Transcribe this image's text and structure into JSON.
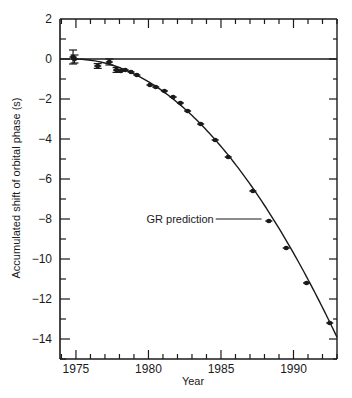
{
  "chart_data": {
    "type": "scatter",
    "title": "",
    "xlabel": "Year",
    "ylabel": "Accumulated shift of orbital phase (s)",
    "xlim": [
      1973.9,
      1993.0
    ],
    "ylim": [
      -15,
      2
    ],
    "xticks": [
      1975,
      1980,
      1985,
      1990
    ],
    "xtick_labels": [
      "1975",
      "1980",
      "1985",
      "1990"
    ],
    "x_minor_step": 1,
    "yticks": [
      2,
      0,
      -2,
      -4,
      -6,
      -8,
      -10,
      -12,
      -14
    ],
    "ytick_labels": [
      "2",
      "0",
      "−2",
      "−4",
      "−6",
      "−8",
      "−10",
      "−12",
      "−14"
    ],
    "y_minor_step": 1,
    "grid": false,
    "reference_line": {
      "y": 0
    },
    "series": [
      {
        "name": "Observed",
        "type": "scatter",
        "points": [
          {
            "x": 1974.8,
            "y": 0.1,
            "err": 0.35
          },
          {
            "x": 1974.9,
            "y": 0.0,
            "err": 0.2
          },
          {
            "x": 1976.5,
            "y": -0.35,
            "err": 0.12
          },
          {
            "x": 1977.3,
            "y": -0.15,
            "err": 0.15
          },
          {
            "x": 1977.8,
            "y": -0.55,
            "err": 0.12
          },
          {
            "x": 1978.1,
            "y": -0.6,
            "err": 0.1
          },
          {
            "x": 1978.4,
            "y": -0.55,
            "err": 0.1
          },
          {
            "x": 1978.8,
            "y": -0.65,
            "err": 0.1
          },
          {
            "x": 1979.2,
            "y": -0.8,
            "err": 0.08
          },
          {
            "x": 1980.1,
            "y": -1.3,
            "err": 0.06
          },
          {
            "x": 1980.5,
            "y": -1.4,
            "err": 0.06
          },
          {
            "x": 1981.1,
            "y": -1.6,
            "err": 0.06
          },
          {
            "x": 1981.7,
            "y": -1.9,
            "err": 0.06
          },
          {
            "x": 1982.2,
            "y": -2.2,
            "err": 0.06
          },
          {
            "x": 1982.7,
            "y": -2.6,
            "err": 0.06
          },
          {
            "x": 1983.6,
            "y": -3.25,
            "err": 0.06
          },
          {
            "x": 1984.6,
            "y": -4.05,
            "err": 0.06
          },
          {
            "x": 1985.5,
            "y": -4.9,
            "err": 0.06
          },
          {
            "x": 1987.2,
            "y": -6.6,
            "err": 0.06
          },
          {
            "x": 1988.3,
            "y": -8.1,
            "err": 0.06
          },
          {
            "x": 1989.5,
            "y": -9.45,
            "err": 0.06
          },
          {
            "x": 1990.9,
            "y": -11.2,
            "err": 0.06
          },
          {
            "x": 1992.5,
            "y": -13.2,
            "err": 0.06
          }
        ]
      },
      {
        "name": "GR prediction",
        "type": "line",
        "model": "quadratic",
        "t0": 1974.8,
        "coef": -0.042,
        "x_range": [
          1974.8,
          1993.0
        ]
      }
    ],
    "annotations": [
      {
        "text": "GR prediction",
        "x": 1984.5,
        "y": -8.0,
        "pointer_to_x": 1987.8
      }
    ],
    "colors": {
      "ink": "#1a1a1a",
      "background": "#ffffff"
    }
  }
}
